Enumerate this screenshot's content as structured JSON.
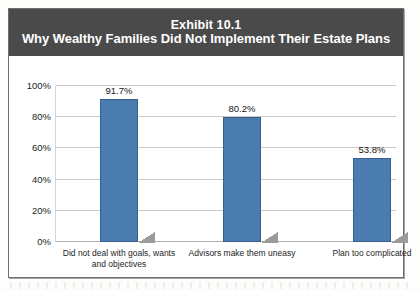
{
  "figure": {
    "title_line1": "Exhibit 10.1",
    "title_line2": "Why Wealthy Families Did Not Implement Their Estate Plans",
    "banner_color": "#4a4a4a",
    "bar_color": "#4a7cb0",
    "frame_color": "#6e6e6e"
  },
  "chart_data": {
    "type": "bar",
    "title": "Exhibit 10.1 Why Wealthy Families Did Not Implement Their Estate Plans",
    "categories": [
      "Did not deal with goals, wants and objectives",
      "Advisors make them uneasy",
      "Plan too complicated"
    ],
    "values": [
      91.7,
      80.2,
      53.8
    ],
    "value_labels": [
      "91.7%",
      "80.2%",
      "53.8%"
    ],
    "xlabel": "",
    "ylabel": "",
    "ylim": [
      0,
      100
    ],
    "ytick_values": [
      100,
      80,
      60,
      40,
      20,
      0
    ],
    "ytick_labels": [
      "100%",
      "80%",
      "60%",
      "40%",
      "20%",
      "0%"
    ],
    "grid": true,
    "legend": false,
    "legend_position": "none"
  }
}
